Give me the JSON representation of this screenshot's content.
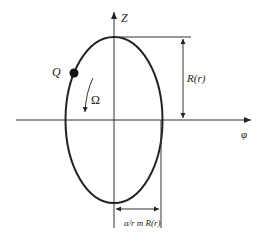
{
  "diagram": {
    "axes": {
      "vertical_label": "Z",
      "horizontal_label": "φ"
    },
    "point": {
      "label": "Q"
    },
    "rotation": {
      "label": "Ω"
    },
    "dimensions": {
      "height_label": "R(r)",
      "width_label": "a/r m R(r)"
    },
    "colors": {
      "stroke": "#222222",
      "background": "#ffffff"
    }
  }
}
